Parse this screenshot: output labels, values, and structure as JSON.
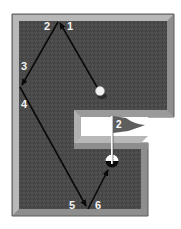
{
  "diagram": {
    "type": "mini-golf-hole-bank-shot",
    "hole_number": "2",
    "colors": {
      "background": "#ffffff",
      "felt": "#4a4a4a",
      "border_light": "#b8b8b8",
      "border_mid": "#8e8e8e",
      "border_dark": "#5c5c5c",
      "path": "#0a0a0a",
      "label": "#f0f0f0",
      "ball": "#f2f2f2",
      "hole": "#0a0a0a",
      "flag": "#5e5e5e",
      "pole": "#ffffff"
    },
    "path_labels": [
      {
        "id": "1",
        "text": "1"
      },
      {
        "id": "2",
        "text": "2"
      },
      {
        "id": "3",
        "text": "3"
      },
      {
        "id": "4",
        "text": "4"
      },
      {
        "id": "5",
        "text": "5"
      },
      {
        "id": "6",
        "text": "6"
      }
    ],
    "flag_label": "2"
  }
}
